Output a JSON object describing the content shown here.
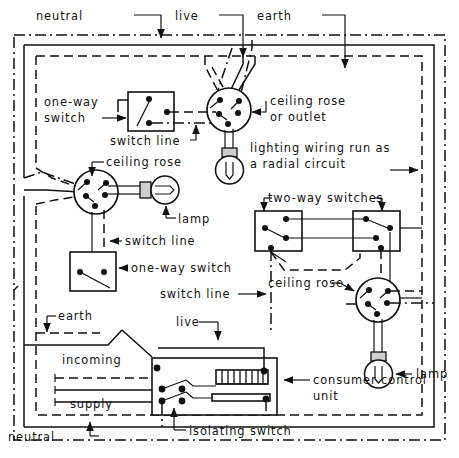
{
  "diagram": {
    "title": "lighting wiring run as a radial circuit",
    "type": "electrical-wiring-diagram",
    "colors": {
      "line": "#111111",
      "background": "#ffffff",
      "cap_shade": "#cfcfcf"
    },
    "labels": {
      "neutral_top": "neutral",
      "live_top": "live",
      "earth_top": "earth",
      "one_way_switch_1_line1": "one-way",
      "one_way_switch_1_line2": "switch",
      "ceiling_rose_outlet_line1": "ceiling rose",
      "ceiling_rose_outlet_line2": "or outlet",
      "switch_line_1": "switch line",
      "radial_note_line1": "lighting wiring run as",
      "radial_note_line2": "a radial circuit",
      "ceiling_rose_2": "ceiling rose",
      "lamp_1": "lamp",
      "switch_line_2": "switch line",
      "one_way_switch_2": "one-way switch",
      "two_way_switches": "two-way switches",
      "ceiling_rose_3": "ceiling rose",
      "switch_line_3": "switch line",
      "earth_bottom": "earth",
      "live_bottom": "live",
      "incoming": "incoming",
      "supply": "supply",
      "neutral_bottom": "neutral",
      "isolating_switch": "isolating switch",
      "consumer_unit_line1": "consumer control",
      "consumer_unit_line2": "unit",
      "lamp_2": "lamp"
    },
    "components": {
      "ceiling_roses": 3,
      "lamps": 3,
      "one_way_switches": 2,
      "two_way_switches": 2,
      "consumer_control_units": 1,
      "isolating_switches": 1,
      "fuse_ways": 9
    },
    "conductors": [
      {
        "name": "neutral",
        "style": "solid"
      },
      {
        "name": "live",
        "style": "dashed"
      },
      {
        "name": "earth",
        "style": "dash-dot"
      }
    ]
  }
}
